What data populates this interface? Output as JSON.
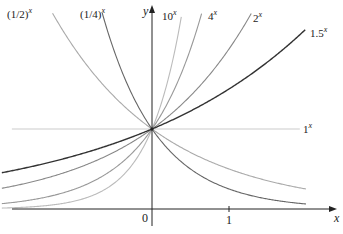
{
  "chart_data": {
    "type": "line",
    "title": "",
    "xlabel": "x",
    "ylabel": "y",
    "xlim": [
      -1.95,
      2.35
    ],
    "ylim": [
      -0.3,
      2.6
    ],
    "x_ticks": [
      {
        "value": 0,
        "label": "0"
      },
      {
        "value": 1,
        "label": "1"
      }
    ],
    "grid": false,
    "legend": "inline labels at curve ends",
    "clip_y_max": 2.46,
    "series": [
      {
        "name": "(1/2)^x",
        "label_base": "(1/2)",
        "label_exp": "x",
        "base": 0.5,
        "x_range": [
          -1.95,
          2.0
        ],
        "color": "#aaaaaa",
        "width": 1.1,
        "label_pos": [
          7,
          18
        ]
      },
      {
        "name": "(1/4)^x",
        "label_base": "(1/4)",
        "label_exp": "x",
        "base": 0.25,
        "x_range": [
          -1.95,
          2.0
        ],
        "color": "#666666",
        "width": 1.1,
        "label_pos": [
          80,
          18
        ]
      },
      {
        "name": "10^x",
        "label_base": "10",
        "label_exp": "x",
        "base": 10,
        "x_range": [
          -1.95,
          2.0
        ],
        "color": "#bbbbbb",
        "width": 1.1,
        "label_pos": [
          162,
          20
        ]
      },
      {
        "name": "4^x",
        "label_base": "4",
        "label_exp": "x",
        "base": 4,
        "x_range": [
          -1.95,
          2.0
        ],
        "color": "#999999",
        "width": 1.1,
        "label_pos": [
          208,
          20
        ]
      },
      {
        "name": "2^x",
        "label_base": "2",
        "label_exp": "x",
        "base": 2,
        "x_range": [
          -1.95,
          2.0
        ],
        "color": "#888888",
        "width": 1.1,
        "label_pos": [
          253,
          22
        ]
      },
      {
        "name": "1.5^x",
        "label_base": "1.5",
        "label_exp": "x",
        "base": 1.5,
        "x_range": [
          -1.95,
          1.99
        ],
        "color": "#333333",
        "width": 1.4,
        "label_pos": [
          310,
          37
        ]
      },
      {
        "name": "1^x",
        "label_base": "1",
        "label_exp": "x",
        "base": 1,
        "x_range": [
          -1.82,
          1.92
        ],
        "color": "#cccccc",
        "width": 1.1,
        "label_pos": [
          303,
          133
        ]
      }
    ]
  },
  "axes": {
    "x_label": "x",
    "y_label": "y",
    "origin_label": "0",
    "tick_one_label": "1",
    "color": "#222222"
  },
  "layout": {
    "origin_px": [
      152,
      209
    ],
    "unit_x_px": 77,
    "unit_y_px": 80
  }
}
